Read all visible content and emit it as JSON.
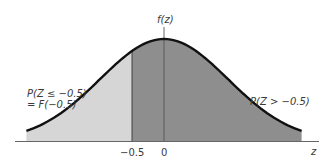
{
  "chart_data": {
    "type": "area",
    "title": "",
    "xlabel": "z",
    "ylabel": "f(z)",
    "distribution": "standard normal density",
    "x_range": [
      -2.15,
      2.15
    ],
    "xticks": [
      {
        "value": -0.5,
        "label": "−0.5"
      },
      {
        "value": 0,
        "label": "0"
      }
    ],
    "cutoff": -0.5,
    "regions": [
      {
        "name": "left-tail",
        "from": -2.15,
        "to": -0.5,
        "shade": "light",
        "color": "#d6d6d6",
        "label_line1": "P(Z ≤ −0.5)",
        "label_line2": "= F(−0.5)"
      },
      {
        "name": "right-region",
        "from": -0.5,
        "to": 2.15,
        "shade": "dark",
        "color": "#8c8c8c",
        "label_line1": "P(Z > −0.5)"
      }
    ],
    "grid": false,
    "legend": "none"
  },
  "colors": {
    "light_fill": "#d6d6d6",
    "dark_fill": "#8e8e8e",
    "curve": "#111111",
    "axis": "#555555"
  }
}
